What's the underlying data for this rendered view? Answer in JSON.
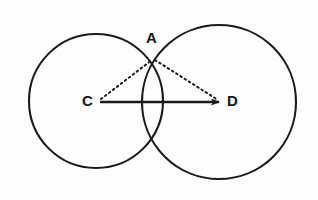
{
  "figure": {
    "background_color": "#fdfdfd",
    "stroke_color": "#1a1a1a",
    "labels": {
      "point_a": "A",
      "point_c": "C",
      "point_d": "D"
    },
    "points": {
      "A": {
        "x": 153,
        "y": 58
      },
      "C": {
        "x": 97,
        "y": 102
      },
      "D": {
        "x": 222,
        "y": 102
      }
    },
    "circles": [
      {
        "name": "circle-c",
        "center_label": "C",
        "cx": 96,
        "cy": 101,
        "r": 67,
        "stroke": "#1a1a1a",
        "stroke_width": 2.1,
        "fill": "none"
      },
      {
        "name": "circle-d",
        "center_label": "D",
        "cx": 219,
        "cy": 102,
        "r": 77,
        "stroke": "#1a1a1a",
        "stroke_width": 2.1,
        "fill": "none"
      }
    ],
    "segments": [
      {
        "name": "segment-cd",
        "from": "C",
        "to": "D",
        "style": "solid",
        "arrow": "end",
        "x1": 100,
        "y1": 102,
        "x2": 221,
        "y2": 102,
        "stroke_width": 2.4
      },
      {
        "name": "segment-ca",
        "from": "C",
        "to": "A",
        "style": "dotted",
        "arrow": "none",
        "x1": 101,
        "y1": 99,
        "x2": 152,
        "y2": 60,
        "stroke_width": 2.0
      },
      {
        "name": "segment-ad",
        "from": "A",
        "to": "D",
        "style": "dotted",
        "arrow": "none",
        "x1": 155,
        "y1": 60,
        "x2": 219,
        "y2": 100,
        "stroke_width": 2.0
      }
    ]
  }
}
